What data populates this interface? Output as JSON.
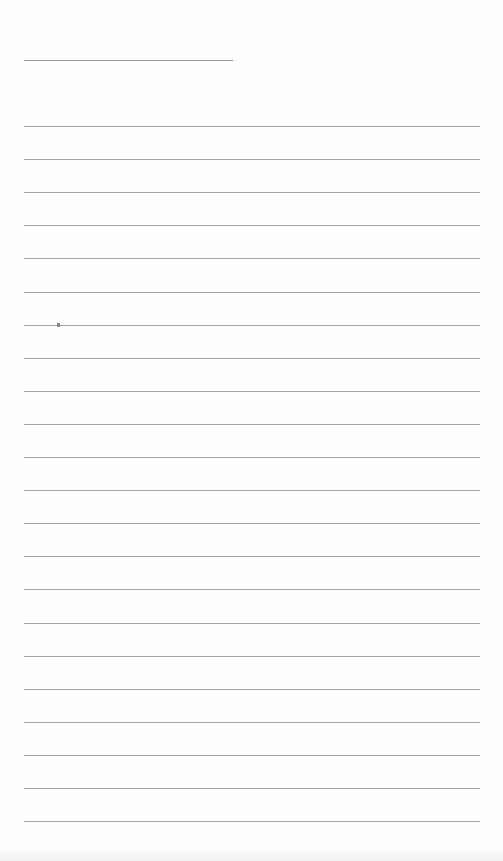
{
  "page": {
    "type": "lined-paper",
    "background_color": "#fdfdfd",
    "line_color": "#a4a4a4"
  },
  "header_line": {
    "left": 24,
    "top": 60,
    "width": 209
  },
  "ruled_lines": {
    "count": 22,
    "first_top": 126,
    "spacing": 33.1,
    "left": 24,
    "width": 456
  }
}
